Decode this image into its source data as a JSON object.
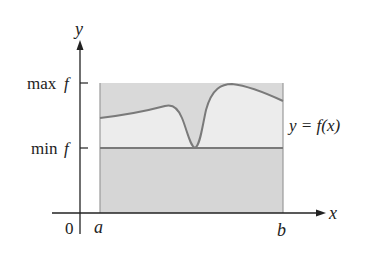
{
  "diagram": {
    "type": "function-bounds-illustration",
    "axes": {
      "x_label": "x",
      "y_label": "y",
      "origin_label": "0"
    },
    "x_ticks": [
      {
        "label": "a"
      },
      {
        "label": "b"
      }
    ],
    "y_ticks": [
      {
        "label_main": "max",
        "label_var": "f"
      },
      {
        "label_main": "min",
        "label_var": "f"
      }
    ],
    "curve_label": "y = f(x)",
    "colors": {
      "outer_rect": "#d9d9d9",
      "inner_region": "#ebebeb",
      "curve": "#7a7a7a",
      "min_line": "#7a7a7a",
      "axis": "#222222"
    }
  }
}
